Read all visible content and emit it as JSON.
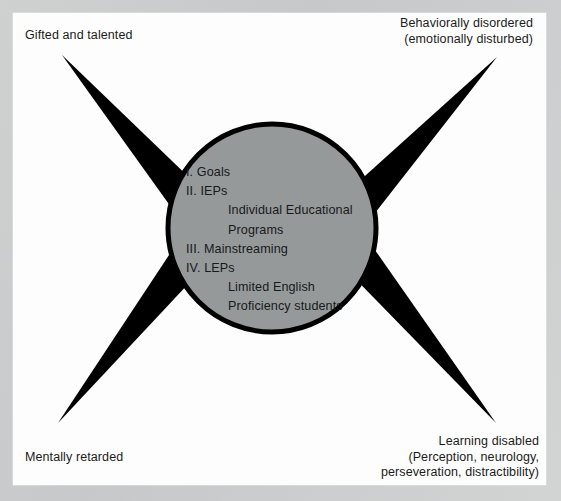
{
  "figure": {
    "type": "four-pointed-star-diagram",
    "background_color": "#c9cbcb",
    "panel_color": "#fdfdfd",
    "circle_fill_color": "#96999a",
    "circle_stroke_color": "#000000",
    "star_color": "#000000",
    "text_color": "#1b1b1b",
    "corner_labels": {
      "top_left": "Gifted and talented",
      "top_right": "Behaviorally disordered\n(emotionally disturbed)",
      "bottom_left": "Mentally retarded",
      "bottom_right": "Learning disabled\n(Perception, neurology,\nperseveration, distractibility)"
    },
    "center_list": [
      {
        "text": "I. Goals",
        "indent": false
      },
      {
        "text": "II. IEPs",
        "indent": false
      },
      {
        "text": "Individual Educational",
        "indent": true
      },
      {
        "text": "Programs",
        "indent": true
      },
      {
        "text": "III. Mainstreaming",
        "indent": false
      },
      {
        "text": "IV. LEPs",
        "indent": false
      },
      {
        "text": "Limited English",
        "indent": true
      },
      {
        "text": "Proficiency students",
        "indent": true
      }
    ],
    "geometry": {
      "circle_center_x": 272,
      "circle_center_y": 228,
      "circle_radius": 107,
      "spike_tip_top_left": [
        62,
        55
      ],
      "spike_tip_top_right": [
        497,
        57
      ],
      "spike_tip_bottom_left": [
        58,
        423
      ],
      "spike_tip_bottom_right": [
        496,
        423
      ]
    }
  }
}
